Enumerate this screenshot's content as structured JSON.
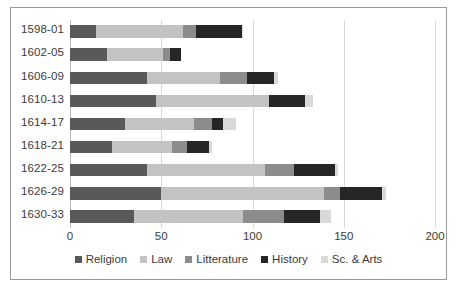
{
  "chart_data": {
    "type": "bar",
    "orientation": "horizontal",
    "stacked": true,
    "title": "",
    "xlabel": "",
    "ylabel": "",
    "xlim": [
      0,
      200
    ],
    "xticks": [
      0,
      50,
      100,
      150,
      200
    ],
    "grid": true,
    "legend_position": "bottom",
    "categories": [
      "1598-01",
      "1602-05",
      "1606-09",
      "1610-13",
      "1614-17",
      "1618-21",
      "1622-25",
      "1626-29",
      "1630-33"
    ],
    "series": [
      {
        "name": "Religion",
        "color": "#595959",
        "values": [
          14,
          20,
          42,
          47,
          30,
          23,
          42,
          50,
          35
        ]
      },
      {
        "name": "Law",
        "color": "#c3c3c3",
        "values": [
          48,
          31,
          40,
          62,
          38,
          33,
          65,
          89,
          60
        ]
      },
      {
        "name": "Litterature",
        "color": "#8c8c8c",
        "values": [
          7,
          4,
          15,
          0,
          10,
          8,
          16,
          9,
          22
        ]
      },
      {
        "name": "History",
        "color": "#262626",
        "values": [
          25,
          6,
          15,
          20,
          6,
          12,
          22,
          23,
          20
        ]
      },
      {
        "name": "Sc. & Arts",
        "color": "#d9d9d9",
        "values": [
          1,
          0,
          2,
          4,
          7,
          2,
          2,
          2,
          6
        ]
      }
    ],
    "totals": [
      95,
      61,
      114,
      133,
      91,
      78,
      147,
      173,
      143
    ]
  },
  "legend": {
    "items": [
      {
        "label": "Religion"
      },
      {
        "label": "Law"
      },
      {
        "label": "Litterature"
      },
      {
        "label": "History"
      },
      {
        "label": "Sc. & Arts"
      }
    ]
  },
  "caption": {
    "text": ""
  }
}
